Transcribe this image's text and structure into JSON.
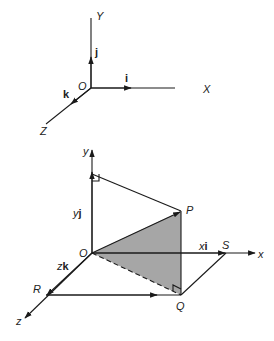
{
  "top_frame": {
    "axes": {
      "y_label": "Y",
      "x_label": "X",
      "z_label": "Z",
      "origin_label": "O"
    },
    "unit_vectors": {
      "i": "i",
      "j": "j",
      "k": "k"
    }
  },
  "bottom_frame": {
    "axes": {
      "y_label": "y",
      "x_label": "x",
      "z_label": "z",
      "origin_label": "O"
    },
    "points": {
      "P": "P",
      "Q": "Q",
      "R": "R",
      "S": "S"
    },
    "components": {
      "yj": {
        "coef": "y",
        "vec": "j"
      },
      "xi": {
        "coef": "x",
        "vec": "i"
      },
      "zk": {
        "coef": "z",
        "vec": "k"
      }
    },
    "colors": {
      "shaded_triangle": "#a6a6a6",
      "lines": "#1a1a1a"
    }
  }
}
